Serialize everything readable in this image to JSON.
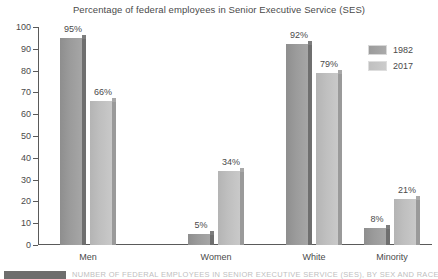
{
  "chart_data": {
    "type": "bar",
    "title": "Percentage of federal employees in Senior Executive Service (SES)",
    "xlabel": "",
    "ylabel": "",
    "ylim": [
      0,
      100
    ],
    "yticks": [
      0,
      10,
      20,
      30,
      40,
      50,
      60,
      70,
      80,
      90,
      100
    ],
    "grid": false,
    "legend_position": "top-right",
    "categories": [
      "Men",
      "Women",
      "White",
      "Minority"
    ],
    "series": [
      {
        "name": "1982",
        "color": "#9b9b9b",
        "values": [
          95,
          5,
          92,
          8
        ]
      },
      {
        "name": "2017",
        "color": "#c4c4c4",
        "values": [
          66,
          34,
          79,
          21
        ]
      }
    ],
    "value_labels": [
      [
        "95%",
        "5%",
        "92%",
        "8%"
      ],
      [
        "66%",
        "34%",
        "79%",
        "21%"
      ]
    ]
  },
  "legend": {
    "items": [
      {
        "label": "1982"
      },
      {
        "label": "2017"
      }
    ]
  },
  "caption": {
    "text": "NUMBER OF FEDERAL EMPLOYEES IN SENIOR EXECUTIVE SERVICE (SES), BY SEX AND RACE"
  }
}
